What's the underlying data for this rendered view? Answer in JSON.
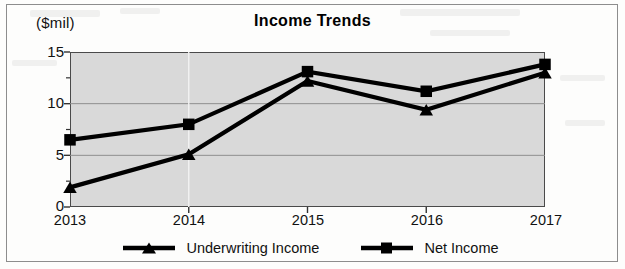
{
  "chart_data": {
    "type": "line",
    "title": "Income Trends",
    "ylabel": "($mil)",
    "xlabel": "",
    "categories": [
      "2013",
      "2014",
      "2015",
      "2016",
      "2017"
    ],
    "series": [
      {
        "name": "Underwriting Income",
        "marker": "triangle",
        "values": [
          1.9,
          5.1,
          12.2,
          9.4,
          13.0
        ]
      },
      {
        "name": "Net Income",
        "marker": "square",
        "values": [
          6.5,
          8.0,
          13.1,
          11.2,
          13.8
        ]
      }
    ],
    "ylim": [
      0,
      15
    ],
    "yticks": [
      0,
      5,
      10,
      15
    ],
    "ytick_labels": [
      "0",
      "5",
      "10",
      "15"
    ],
    "yminor_ticks": [
      2.5,
      7.5,
      12.5
    ],
    "grid": true,
    "legend_position": "bottom",
    "colors": {
      "line": "#000000",
      "plot_background": "#d9d9d9",
      "gridline": "#8f8f8f",
      "axis": "#333333",
      "text": "#111111"
    }
  },
  "legend": {
    "entries": [
      {
        "label": "Underwriting Income"
      },
      {
        "label": "Net Income"
      }
    ]
  }
}
